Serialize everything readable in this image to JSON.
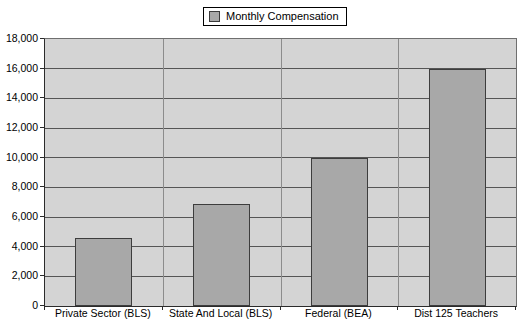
{
  "legend": {
    "label": "Monthly Compensation",
    "swatch_color": "#a8a8a8",
    "position": "top-center"
  },
  "colors": {
    "plot_background": "#d4d4d4",
    "bar_fill": "#a8a8a8",
    "bar_border": "#3d3d3d",
    "gridline": "#555555",
    "axis": "#2b2b2b",
    "page_background": "#ffffff",
    "text": "#000000"
  },
  "chart_data": {
    "type": "bar",
    "title": "",
    "subtitle": "",
    "xlabel": "",
    "ylabel": "",
    "categories": [
      "Private Sector (BLS)",
      "State And Local (BLS)",
      "Federal (BEA)",
      "Dist 125 Teachers"
    ],
    "series": [
      {
        "name": "Monthly Compensation",
        "values": [
          4600,
          6900,
          10000,
          16000
        ]
      }
    ],
    "values": [
      4600,
      6900,
      10000,
      16000
    ],
    "ylim": [
      0,
      18000
    ],
    "ytick_step": 2000,
    "ytick_labels": [
      "0",
      "2,000",
      "4,000",
      "6,000",
      "8,000",
      "10,000",
      "12,000",
      "14,000",
      "16,000",
      "18,000"
    ],
    "ytick_values": [
      0,
      2000,
      4000,
      6000,
      8000,
      10000,
      12000,
      14000,
      16000,
      18000
    ],
    "grid": true,
    "grid_axis": "y",
    "legend_position": "top-center",
    "orientation": "vertical"
  }
}
